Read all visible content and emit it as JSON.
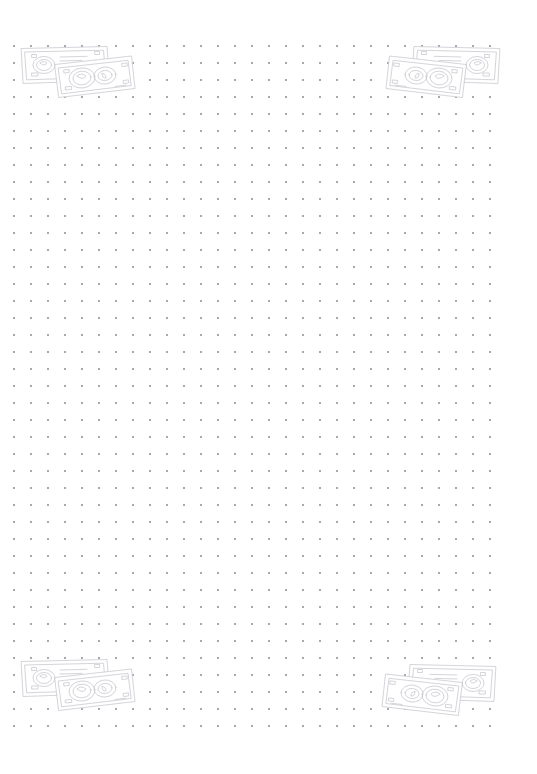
{
  "page": {
    "kind": "dot-grid-notepad-page",
    "width_px": 537,
    "height_px": 774,
    "background_color": "#ffffff",
    "text_content": ""
  },
  "dot_grid": {
    "name": "dot-grid",
    "dot_color": "#a8a8ae",
    "dot_size_px": 2,
    "spacing_x_px": 17,
    "spacing_y_px": 17,
    "origin_x_px": 13,
    "origin_y_px": 45,
    "columns": 29,
    "rows": 41,
    "shape": "square"
  },
  "illustrations": {
    "name": "corner-money-sketches",
    "style": "hand-drawn-line-art",
    "stroke_color": "#c9c9d0",
    "fill_color": "#ffffff",
    "count": 4,
    "subject": "two overlapping banknotes",
    "items": [
      {
        "id": "top-left",
        "label": "money-sketch-top-left",
        "x_px": 14,
        "y_px": 44,
        "width_px": 122,
        "height_px": 55,
        "mirrored": false
      },
      {
        "id": "top-right",
        "label": "money-sketch-top-right",
        "x_px": 385,
        "y_px": 44,
        "width_px": 122,
        "height_px": 55,
        "mirrored": true
      },
      {
        "id": "bottom-left",
        "label": "money-sketch-bottom-left",
        "x_px": 14,
        "y_px": 657,
        "width_px": 122,
        "height_px": 55,
        "mirrored": false
      },
      {
        "id": "bottom-right",
        "label": "money-sketch-bottom-right",
        "x_px": 381,
        "y_px": 662,
        "width_px": 122,
        "height_px": 55,
        "mirrored": true
      }
    ]
  }
}
